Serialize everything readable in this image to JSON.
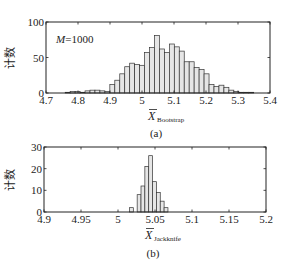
{
  "chart_data": [
    {
      "type": "bar",
      "panel": "(a)",
      "title": "",
      "annotation": "M=1000",
      "xlabel": "X̄",
      "xlabel_subscript": "Bootstrap",
      "ylabel": "计数",
      "xlim": [
        4.7,
        5.4
      ],
      "ylim": [
        0,
        100
      ],
      "xticks": [
        "4.7",
        "4.8",
        "4.9",
        "5",
        "5.1",
        "5.2",
        "5.3",
        "5.4"
      ],
      "yticks": [
        "0",
        "50",
        "100"
      ],
      "grid": false,
      "bin_width": 0.0155,
      "bin_starts": [
        4.76,
        4.7755,
        4.791,
        4.8065,
        4.822,
        4.8375,
        4.853,
        4.8685,
        4.884,
        4.8995,
        4.915,
        4.9305,
        4.946,
        4.9615,
        4.977,
        4.9925,
        5.008,
        5.0235,
        5.039,
        5.0545,
        5.07,
        5.0855,
        5.101,
        5.1165,
        5.132,
        5.1475,
        5.163,
        5.1785,
        5.194,
        5.2095,
        5.225,
        5.2405,
        5.256,
        5.2715,
        5.287,
        5.3025,
        5.318,
        5.3335
      ],
      "values": [
        1,
        2,
        2,
        1,
        3,
        4,
        4,
        3,
        2,
        12,
        18,
        27,
        37,
        42,
        40,
        39,
        57,
        64,
        81,
        62,
        57,
        69,
        65,
        59,
        44,
        44,
        36,
        33,
        27,
        12,
        9,
        11,
        8,
        4,
        2,
        1,
        1,
        1
      ]
    },
    {
      "type": "bar",
      "panel": "(b)",
      "title": "",
      "xlabel": "X̄",
      "xlabel_subscript": "Jackknife",
      "ylabel": "计数",
      "xlim": [
        4.9,
        5.2
      ],
      "ylim": [
        0,
        30
      ],
      "xticks": [
        "4.9",
        "4.95",
        "5",
        "5.05",
        "5.1",
        "5.15",
        "5.2"
      ],
      "yticks": [
        "0",
        "10",
        "20",
        "30"
      ],
      "grid": false,
      "bin_width": 0.0052,
      "bin_starts": [
        5.0155,
        5.0259,
        5.0311,
        5.0363,
        5.0415,
        5.0467,
        5.0519,
        5.0571,
        5.0623
      ],
      "values": [
        2,
        8,
        12,
        21,
        26,
        14,
        9,
        5,
        2
      ]
    }
  ]
}
